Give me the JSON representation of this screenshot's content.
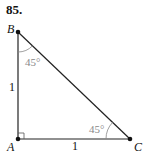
{
  "problem_number": "85.",
  "vertices": {
    "A": {
      "label": "A"
    },
    "B": {
      "label": "B"
    },
    "C": {
      "label": "C"
    }
  },
  "sides": {
    "AB": "1",
    "AC": "1"
  },
  "angles": {
    "B": "45°",
    "C": "45°"
  },
  "colors": {
    "line": "#222222",
    "angle_text": "#888888"
  }
}
